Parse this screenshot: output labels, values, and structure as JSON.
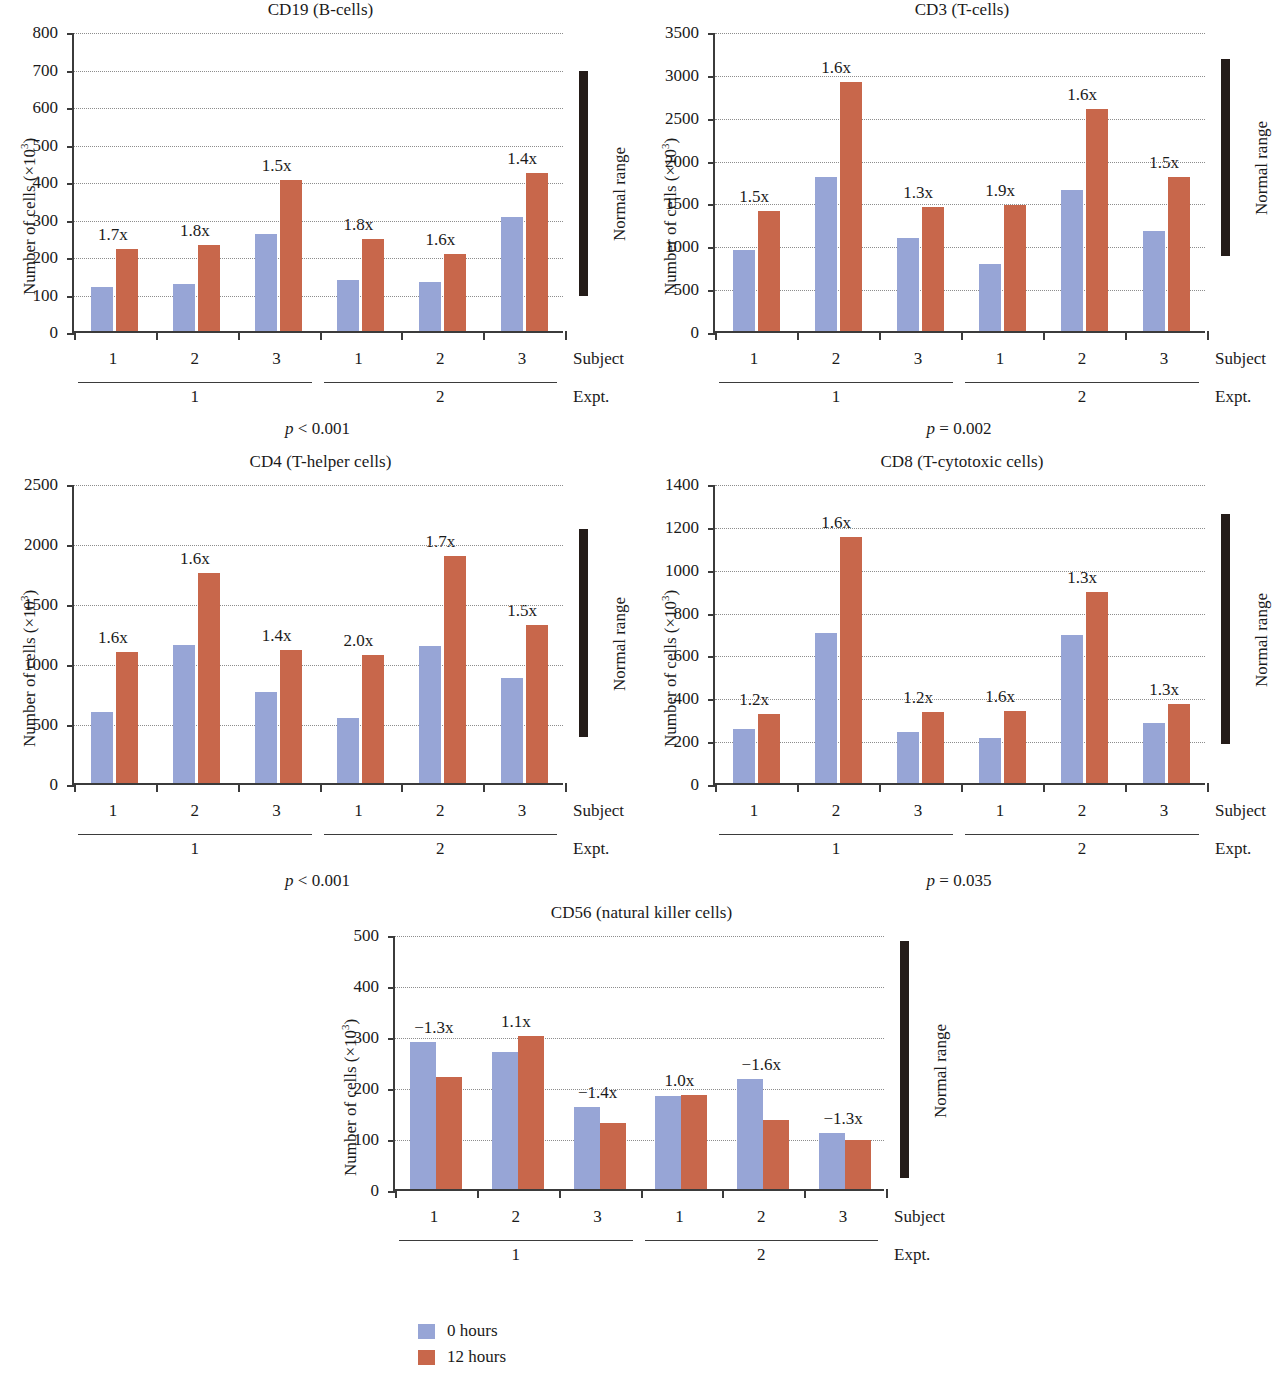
{
  "colors": {
    "series_0h": "#97a5d6",
    "series_12h": "#c8674b",
    "axis": "#3b3b3b",
    "normal_range": "#241c19",
    "grid": "#8d8d8d"
  },
  "axis_labels": {
    "ylabel_prefix": "Number of cells (×10",
    "ylabel_exp": "3",
    "ylabel_suffix": ")",
    "subject_caption": "Subject",
    "expt_caption": "Expt."
  },
  "legend": {
    "position": "bottom-center",
    "items": [
      {
        "label": "0 hours",
        "color": "#97a5d6",
        "swatch": "blue"
      },
      {
        "label": "12 hours",
        "color": "#c8674b",
        "swatch": "red"
      }
    ]
  },
  "chart_data": [
    {
      "id": "cd19",
      "type": "bar",
      "title": "CD19 (B-cells)",
      "xlabel": "Subject",
      "ylabel": "Number of cells (×10³)",
      "ylim": [
        0,
        800
      ],
      "yticks": [
        0,
        100,
        200,
        300,
        400,
        500,
        600,
        700,
        800
      ],
      "grid": true,
      "categories": [
        "1",
        "2",
        "3",
        "1",
        "2",
        "3"
      ],
      "groups": [
        {
          "label": "1",
          "expt": "1"
        },
        {
          "label": "2",
          "expt": "1"
        },
        {
          "label": "3",
          "expt": "1"
        },
        {
          "label": "1",
          "expt": "2"
        },
        {
          "label": "2",
          "expt": "2"
        },
        {
          "label": "3",
          "expt": "2"
        }
      ],
      "series": [
        {
          "name": "0 hours",
          "values": [
            118,
            126,
            260,
            136,
            131,
            303
          ]
        },
        {
          "name": "12 hours",
          "values": [
            220,
            229,
            402,
            245,
            206,
            422
          ]
        }
      ],
      "fold_labels": [
        "1.7x",
        "1.8x",
        "1.5x",
        "1.8x",
        "1.6x",
        "1.4x"
      ],
      "normal_range": [
        100,
        700
      ],
      "normal_range_label": "Normal range",
      "pvalue": "p < 0.001",
      "expt_labels": [
        "1",
        "2"
      ]
    },
    {
      "id": "cd3",
      "type": "bar",
      "title": "CD3 (T-cells)",
      "xlabel": "Subject",
      "ylabel": "Number of cells (×10³)",
      "ylim": [
        0,
        3500
      ],
      "yticks": [
        0,
        500,
        1000,
        1500,
        2000,
        2500,
        3000,
        3500
      ],
      "grid": true,
      "categories": [
        "1",
        "2",
        "3",
        "1",
        "2",
        "3"
      ],
      "groups": [
        {
          "label": "1",
          "expt": "1"
        },
        {
          "label": "2",
          "expt": "1"
        },
        {
          "label": "3",
          "expt": "1"
        },
        {
          "label": "1",
          "expt": "2"
        },
        {
          "label": "2",
          "expt": "2"
        },
        {
          "label": "3",
          "expt": "2"
        }
      ],
      "series": [
        {
          "name": "0 hours",
          "values": [
            940,
            1800,
            1090,
            780,
            1650,
            1165
          ]
        },
        {
          "name": "12 hours",
          "values": [
            1400,
            2900,
            1450,
            1475,
            2585,
            1800
          ]
        }
      ],
      "fold_labels": [
        "1.5x",
        "1.6x",
        "1.3x",
        "1.9x",
        "1.6x",
        "1.5x"
      ],
      "normal_range": [
        900,
        3200
      ],
      "normal_range_label": "Normal range",
      "pvalue": "p = 0.002",
      "expt_labels": [
        "1",
        "2"
      ]
    },
    {
      "id": "cd4",
      "type": "bar",
      "title": "CD4 (T-helper cells)",
      "xlabel": "Subject",
      "ylabel": "Number of cells (×10³)",
      "ylim": [
        0,
        2500
      ],
      "yticks": [
        0,
        500,
        1000,
        1500,
        2000,
        2500
      ],
      "grid": true,
      "categories": [
        "1",
        "2",
        "3",
        "1",
        "2",
        "3"
      ],
      "groups": [
        {
          "label": "1",
          "expt": "1"
        },
        {
          "label": "2",
          "expt": "1"
        },
        {
          "label": "3",
          "expt": "1"
        },
        {
          "label": "1",
          "expt": "2"
        },
        {
          "label": "2",
          "expt": "2"
        },
        {
          "label": "3",
          "expt": "2"
        }
      ],
      "series": [
        {
          "name": "0 hours",
          "values": [
            595,
            1150,
            755,
            545,
            1140,
            875
          ]
        },
        {
          "name": "12 hours",
          "values": [
            1095,
            1750,
            1105,
            1070,
            1890,
            1320
          ]
        }
      ],
      "fold_labels": [
        "1.6x",
        "1.6x",
        "1.4x",
        "2.0x",
        "1.7x",
        "1.5x"
      ],
      "normal_range": [
        400,
        2130
      ],
      "normal_range_label": "Normal range",
      "pvalue": "p < 0.001",
      "expt_labels": [
        "1",
        "2"
      ]
    },
    {
      "id": "cd8",
      "type": "bar",
      "title": "CD8 (T-cytotoxic cells)",
      "xlabel": "Subject",
      "ylabel": "Number of cells (×10³)",
      "ylim": [
        0,
        1400
      ],
      "yticks": [
        0,
        200,
        400,
        600,
        800,
        1000,
        1200,
        1400
      ],
      "grid": true,
      "categories": [
        "1",
        "2",
        "3",
        "1",
        "2",
        "3"
      ],
      "groups": [
        {
          "label": "1",
          "expt": "1"
        },
        {
          "label": "2",
          "expt": "1"
        },
        {
          "label": "3",
          "expt": "1"
        },
        {
          "label": "1",
          "expt": "2"
        },
        {
          "label": "2",
          "expt": "2"
        },
        {
          "label": "3",
          "expt": "2"
        }
      ],
      "series": [
        {
          "name": "0 hours",
          "values": [
            250,
            700,
            240,
            212,
            690,
            280
          ]
        },
        {
          "name": "12 hours",
          "values": [
            322,
            1150,
            330,
            335,
            893,
            368
          ]
        }
      ],
      "fold_labels": [
        "1.2x",
        "1.6x",
        "1.2x",
        "1.6x",
        "1.3x",
        "1.3x"
      ],
      "normal_range": [
        190,
        1265
      ],
      "normal_range_label": "Normal range",
      "pvalue": "p = 0.035",
      "expt_labels": [
        "1",
        "2"
      ]
    },
    {
      "id": "cd56",
      "type": "bar",
      "title": "CD56 (natural killer cells)",
      "xlabel": "Subject",
      "ylabel": "Number of cells (×10³)",
      "ylim": [
        0,
        500
      ],
      "yticks": [
        0,
        100,
        200,
        300,
        400,
        500
      ],
      "grid": true,
      "categories": [
        "1",
        "2",
        "3",
        "1",
        "2",
        "3"
      ],
      "groups": [
        {
          "label": "1",
          "expt": "1"
        },
        {
          "label": "2",
          "expt": "1"
        },
        {
          "label": "3",
          "expt": "1"
        },
        {
          "label": "1",
          "expt": "2"
        },
        {
          "label": "2",
          "expt": "2"
        },
        {
          "label": "3",
          "expt": "2"
        }
      ],
      "series": [
        {
          "name": "0 hours",
          "values": [
            289,
            269,
            160,
            183,
            216,
            110
          ]
        },
        {
          "name": "12 hours",
          "values": [
            219,
            300,
            130,
            184,
            135,
            97
          ]
        }
      ],
      "fold_labels": [
        "−1.3x",
        "1.1x",
        "−1.4x",
        "1.0x",
        "−1.6x",
        "−1.3x"
      ],
      "normal_range": [
        25,
        490
      ],
      "normal_range_label": "Normal range",
      "pvalue": "",
      "expt_labels": [
        "1",
        "2"
      ]
    }
  ],
  "layout": {
    "panels": [
      {
        "id": "cd19",
        "left": 0,
        "top": 0,
        "width": 641,
        "height": 445,
        "tight": false
      },
      {
        "id": "cd3",
        "left": 641,
        "top": 0,
        "width": 642,
        "height": 445,
        "tight": false
      },
      {
        "id": "cd4",
        "left": 0,
        "top": 452,
        "width": 641,
        "height": 445,
        "tight": false
      },
      {
        "id": "cd8",
        "left": 641,
        "top": 452,
        "width": 642,
        "height": 445,
        "tight": false
      },
      {
        "id": "cd56",
        "left": 321,
        "top": 903,
        "width": 641,
        "height": 400,
        "tight": true
      }
    ]
  }
}
